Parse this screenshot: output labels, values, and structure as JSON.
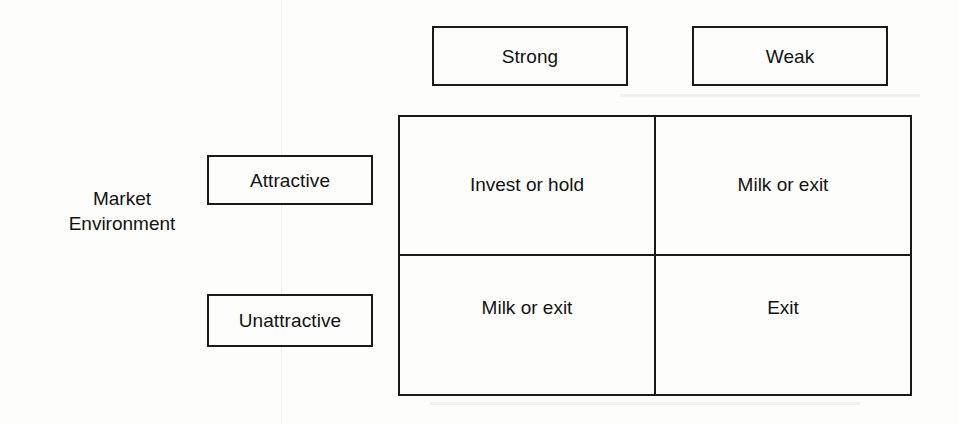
{
  "diagram": {
    "kind": "two-by-two-strategy-matrix",
    "column_axis": {
      "headers": [
        {
          "label": "Strong"
        },
        {
          "label": "Weak"
        }
      ]
    },
    "row_axis": {
      "caption_lines": [
        "Market",
        "Environment"
      ],
      "headers": [
        {
          "label": "Attractive"
        },
        {
          "label": "Unattractive"
        }
      ]
    },
    "matrix": {
      "rows": [
        {
          "row_label": "Attractive",
          "cells": [
            {
              "column_label": "Strong",
              "label": "Invest or hold"
            },
            {
              "column_label": "Weak",
              "label": "Milk or exit"
            }
          ]
        },
        {
          "row_label": "Unattractive",
          "cells": [
            {
              "column_label": "Strong",
              "label": "Milk or exit"
            },
            {
              "column_label": "Weak",
              "label": "Exit"
            }
          ]
        }
      ]
    },
    "colors": {
      "background": "#fdfdfc",
      "line": "#1a1a1a",
      "text": "#121212"
    }
  }
}
